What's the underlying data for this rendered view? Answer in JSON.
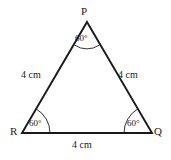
{
  "figure": {
    "type": "equilateral-triangle-diagram",
    "background_color": "#ffffff",
    "stroke_color": "#1a1a1a",
    "vertices": [
      {
        "name": "P",
        "label": "P",
        "x": 87,
        "y": 22
      },
      {
        "name": "R",
        "label": "R",
        "x": 22,
        "y": 133
      },
      {
        "name": "Q",
        "label": "Q",
        "x": 152,
        "y": 133
      }
    ],
    "sides": [
      {
        "name": "PR",
        "label": "4 cm",
        "from": "P",
        "to": "R"
      },
      {
        "name": "PQ",
        "label": "4 cm",
        "from": "P",
        "to": "Q"
      },
      {
        "name": "RQ",
        "label": "4 cm",
        "from": "R",
        "to": "Q"
      }
    ],
    "angles": [
      {
        "name": "P",
        "label": "60°"
      },
      {
        "name": "R",
        "label": "60°"
      },
      {
        "name": "Q",
        "label": "60°"
      }
    ]
  }
}
